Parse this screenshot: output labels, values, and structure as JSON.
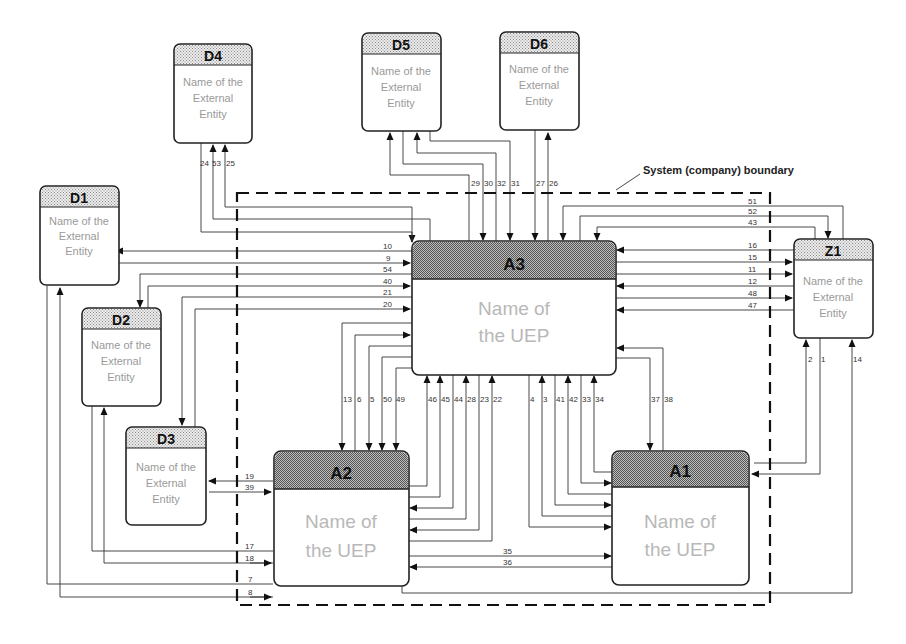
{
  "boundary_label": "System (company) boundary",
  "entities": {
    "D1": {
      "id": "D1",
      "l1": "Name of the",
      "l2": "External",
      "l3": "Entity"
    },
    "D2": {
      "id": "D2",
      "l1": "Name of the",
      "l2": "External",
      "l3": "Entity"
    },
    "D3": {
      "id": "D3",
      "l1": "Name of the",
      "l2": "External",
      "l3": "Entity"
    },
    "D4": {
      "id": "D4",
      "l1": "Name of the",
      "l2": "External",
      "l3": "Entity"
    },
    "D5": {
      "id": "D5",
      "l1": "Name of the",
      "l2": "External",
      "l3": "Entity"
    },
    "D6": {
      "id": "D6",
      "l1": "Name of the",
      "l2": "External",
      "l3": "Entity"
    },
    "Z1": {
      "id": "Z1",
      "l1": "Name of the",
      "l2": "External",
      "l3": "Entity"
    }
  },
  "ueps": {
    "A1": {
      "id": "A1",
      "l1": "Name of",
      "l2": "the UEP"
    },
    "A2": {
      "id": "A2",
      "l1": "Name of",
      "l2": "the UEP"
    },
    "A3": {
      "id": "A3",
      "l1": "Name of",
      "l2": "the UEP"
    }
  },
  "flows": {
    "f1": "1",
    "f2": "2",
    "f3": "3",
    "f4": "4",
    "f5": "5",
    "f6": "6",
    "f7": "7",
    "f8": "8",
    "f9": "9",
    "f10": "10",
    "f11": "11",
    "f12": "12",
    "f13": "13",
    "f14": "14",
    "f15": "15",
    "f16": "16",
    "f17": "17",
    "f18": "18",
    "f19": "19",
    "f20": "20",
    "f21": "21",
    "f22": "22",
    "f23": "23",
    "f24": "24",
    "f25": "25",
    "f26": "26",
    "f27": "27",
    "f28": "28",
    "f29": "29",
    "f30": "30",
    "f31": "31",
    "f32": "32",
    "f33": "33",
    "f34": "34",
    "f35": "35",
    "f36": "36",
    "f37": "37",
    "f38": "38",
    "f39": "39",
    "f40": "40",
    "f41": "41",
    "f42": "42",
    "f43": "43",
    "f44": "44",
    "f45": "45",
    "f46": "46",
    "f47": "47",
    "f48": "48",
    "f49": "49",
    "f50": "50",
    "f51": "51",
    "f52": "52",
    "f53": "53",
    "f54": "54"
  }
}
